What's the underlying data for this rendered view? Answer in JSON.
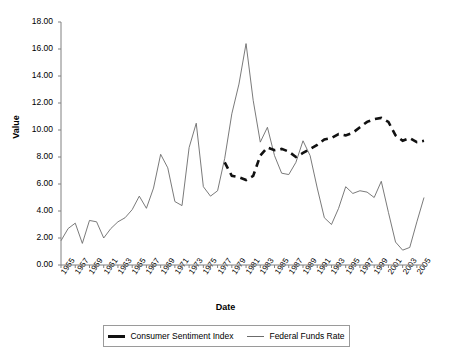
{
  "chart_data": {
    "type": "line",
    "title": "",
    "xlabel": "Date",
    "ylabel": "Value",
    "ylim": [
      0,
      18
    ],
    "yticks": [
      "0.00",
      "2.00",
      "4.00",
      "6.00",
      "8.00",
      "10.00",
      "12.00",
      "14.00",
      "16.00",
      "18.00"
    ],
    "ytick_values": [
      0,
      2,
      4,
      6,
      8,
      10,
      12,
      14,
      16,
      18
    ],
    "grid": false,
    "legend_position": "bottom",
    "x": [
      1955,
      1956,
      1957,
      1958,
      1959,
      1960,
      1961,
      1962,
      1963,
      1964,
      1965,
      1966,
      1967,
      1968,
      1969,
      1970,
      1971,
      1972,
      1973,
      1974,
      1975,
      1976,
      1977,
      1978,
      1979,
      1980,
      1981,
      1982,
      1983,
      1984,
      1985,
      1986,
      1987,
      1988,
      1989,
      1990,
      1991,
      1992,
      1993,
      1994,
      1995,
      1996,
      1997,
      1998,
      1999,
      2000,
      2001,
      2002,
      2003,
      2004,
      2005,
      2006
    ],
    "xtick_labels": [
      "1955",
      "1957",
      "1959",
      "1961",
      "1963",
      "1965",
      "1967",
      "1969",
      "1971",
      "1973",
      "1975",
      "1977",
      "1979",
      "1981",
      "1983",
      "1985",
      "1987",
      "1989",
      "1991",
      "1993",
      "1995",
      "1997",
      "1999",
      "2001",
      "2003",
      "2005"
    ],
    "series": [
      {
        "name": "Consumer Sentiment Index",
        "style": "thick-dashed",
        "color": "#111111",
        "x": [
          1978,
          1979,
          1980,
          1981,
          1982,
          1983,
          1984,
          1985,
          1986,
          1987,
          1988,
          1989,
          1990,
          1991,
          1992,
          1993,
          1994,
          1995,
          1996,
          1997,
          1998,
          1999,
          2000,
          2001,
          2002,
          2003,
          2004,
          2005,
          2006
        ],
        "values": [
          7.6,
          6.6,
          6.5,
          6.3,
          6.6,
          8.1,
          8.7,
          8.5,
          8.6,
          8.4,
          8.0,
          8.3,
          8.6,
          8.9,
          9.3,
          9.4,
          9.7,
          9.6,
          9.8,
          10.2,
          10.6,
          10.8,
          10.9,
          10.6,
          9.6,
          9.2,
          9.4,
          9.1,
          9.2
        ]
      },
      {
        "name": "Federal Funds Rate",
        "style": "thin-solid",
        "color": "#6b6b6b",
        "x": [
          1955,
          1956,
          1957,
          1958,
          1959,
          1960,
          1961,
          1962,
          1963,
          1964,
          1965,
          1966,
          1967,
          1968,
          1969,
          1970,
          1971,
          1972,
          1973,
          1974,
          1975,
          1976,
          1977,
          1978,
          1979,
          1980,
          1981,
          1982,
          1983,
          1984,
          1985,
          1986,
          1987,
          1988,
          1989,
          1990,
          1991,
          1992,
          1993,
          1994,
          1995,
          1996,
          1997,
          1998,
          1999,
          2000,
          2001,
          2002,
          2003,
          2004,
          2005,
          2006
        ],
        "values": [
          1.8,
          2.7,
          3.1,
          1.6,
          3.3,
          3.2,
          2.0,
          2.7,
          3.2,
          3.5,
          4.1,
          5.1,
          4.2,
          5.7,
          8.2,
          7.2,
          4.7,
          4.4,
          8.7,
          10.5,
          5.8,
          5.1,
          5.5,
          7.9,
          11.2,
          13.4,
          16.4,
          12.2,
          9.1,
          10.2,
          8.1,
          6.8,
          6.7,
          7.6,
          9.2,
          8.1,
          5.7,
          3.5,
          3.0,
          4.2,
          5.8,
          5.3,
          5.5,
          5.4,
          5.0,
          6.2,
          3.9,
          1.7,
          1.1,
          1.3,
          3.2,
          5.0
        ]
      }
    ]
  },
  "legend": {
    "items": [
      {
        "label": "Consumer Sentiment Index"
      },
      {
        "label": "Federal Funds Rate"
      }
    ]
  },
  "axes": {
    "x_title": "Date",
    "y_title": "Value"
  }
}
